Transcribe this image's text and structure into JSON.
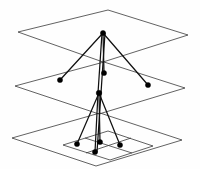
{
  "figure": {
    "background_color": "#fefefe",
    "plane_stroke_color": "#3a3a3a",
    "edge_color": "#111111",
    "node_color": "#000000",
    "layer_count": 3,
    "node_count": 9,
    "edge_count": 10
  },
  "planes": [
    {
      "name": "top-plane",
      "label": "Layer 1",
      "points": "108,10 188,35 103,62 18,32"
    },
    {
      "name": "middle-plane",
      "label": "Layer 2",
      "points": "104,62 185,88 99,114 15,86"
    },
    {
      "name": "bottom-plane",
      "label": "Layer 3",
      "points": "100,113 182,140 96,166 12,138"
    }
  ],
  "inner_grid": [
    {
      "name": "inner-rect",
      "points": "108,131 153,146 110,160 63,145"
    },
    {
      "name": "inner-line-a",
      "x1": 85,
      "y1": 138,
      "x2": 132,
      "y2": 153
    },
    {
      "name": "inner-line-b",
      "x1": 86,
      "y1": 153,
      "x2": 131,
      "y2": 138
    }
  ],
  "nodes": [
    {
      "id": "n1",
      "name": "node-top-hub",
      "layer": 1,
      "cx": 103,
      "cy": 33,
      "r": 2.6
    },
    {
      "id": "n2",
      "name": "node-mid-left",
      "layer": 2,
      "cx": 60,
      "cy": 80,
      "r": 2.6
    },
    {
      "id": "n3",
      "name": "node-mid-center",
      "layer": 2,
      "cx": 104,
      "cy": 73,
      "r": 2.6
    },
    {
      "id": "n4",
      "name": "node-mid-right",
      "layer": 2,
      "cx": 148,
      "cy": 85,
      "r": 2.6
    },
    {
      "id": "n5",
      "name": "node-mid-hub",
      "layer": 2,
      "cx": 99,
      "cy": 93,
      "r": 2.8
    },
    {
      "id": "n6",
      "name": "node-bottom-left",
      "layer": 3,
      "cx": 77,
      "cy": 144,
      "r": 2.6
    },
    {
      "id": "n7",
      "name": "node-bottom-center",
      "layer": 3,
      "cx": 100,
      "cy": 142,
      "r": 2.6
    },
    {
      "id": "n8",
      "name": "node-bottom-right",
      "layer": 3,
      "cx": 120,
      "cy": 145,
      "r": 2.6
    },
    {
      "id": "n9",
      "name": "node-bottom-front",
      "layer": 3,
      "cx": 95,
      "cy": 152,
      "r": 2.6
    }
  ],
  "edges": [
    {
      "name": "edge-hub-to-mid-left",
      "x1": 103,
      "y1": 33,
      "x2": 60,
      "y2": 80
    },
    {
      "name": "edge-hub-to-mid-center",
      "x1": 103,
      "y1": 33,
      "x2": 104,
      "y2": 73
    },
    {
      "name": "edge-hub-to-mid-right",
      "x1": 103,
      "y1": 33,
      "x2": 148,
      "y2": 85
    },
    {
      "name": "edge-hub-to-mid-hub-a",
      "x1": 102,
      "y1": 33,
      "x2": 98,
      "y2": 93
    },
    {
      "name": "edge-hub-to-mid-hub-b",
      "x1": 105,
      "y1": 33,
      "x2": 101,
      "y2": 93
    },
    {
      "name": "edge-midhub-to-bot-left",
      "x1": 99,
      "y1": 93,
      "x2": 77,
      "y2": 144
    },
    {
      "name": "edge-midhub-to-bot-center",
      "x1": 99,
      "y1": 93,
      "x2": 100,
      "y2": 142
    },
    {
      "name": "edge-midhub-to-bot-right",
      "x1": 99,
      "y1": 93,
      "x2": 120,
      "y2": 145
    },
    {
      "name": "edge-midhub-to-bot-front",
      "x1": 98,
      "y1": 93,
      "x2": 95,
      "y2": 152
    },
    {
      "name": "edge-midhub-to-bot-front2",
      "x1": 101,
      "y1": 93,
      "x2": 97,
      "y2": 152
    }
  ]
}
